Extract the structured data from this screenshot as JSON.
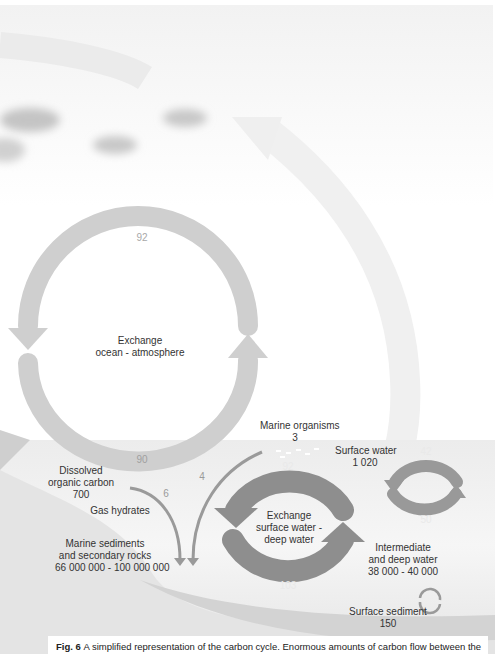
{
  "colors": {
    "sky_arc": "#f0f0f0",
    "atmosphere_cycle": "#cfcfcf",
    "ocean_band": "#ececec",
    "ocean_cycle": "#8e8e8e",
    "deep_band": "#e2e2e2",
    "sediment_band": "#d6d6d6",
    "caption_bg": "#ffffff"
  },
  "atmosphere_cycle": {
    "label_line1": "Exchange",
    "label_line2": "ocean - atmosphere",
    "top_flux": "92",
    "bottom_flux": "90"
  },
  "dissolved_organic_carbon": {
    "line1": "Dissolved",
    "line2": "organic carbon",
    "value": "700"
  },
  "flux_6": "6",
  "flux_4": "4",
  "gas_hydrates": {
    "label": "Gas hydrates"
  },
  "marine_sediments": {
    "line1": "Marine sediments",
    "line2": "and secondary rocks",
    "value": "66 000 000 - 100 000 000"
  },
  "marine_organisms": {
    "label": "Marine organisms",
    "value": "3"
  },
  "surface_water": {
    "label": "Surface water",
    "value": "1 020"
  },
  "deep_exchange_cycle": {
    "label_line1": "Exchange",
    "label_line2": "surface water -",
    "label_line3": "deep water",
    "top_flux": "92",
    "bottom_flux": "103"
  },
  "small_cycle": {
    "top_flux": "42",
    "bottom_flux": "50"
  },
  "intermediate_deep_water": {
    "line1": "Intermediate",
    "line2": "and deep water",
    "value": "38 000 - 40 000"
  },
  "surface_sediment": {
    "label": "Surface sediment",
    "value": "150"
  },
  "caption": {
    "fig_label": "Fig. 6",
    "text": "A simplified representation of the carbon cycle. Enormous amounts of carbon flow between the"
  }
}
